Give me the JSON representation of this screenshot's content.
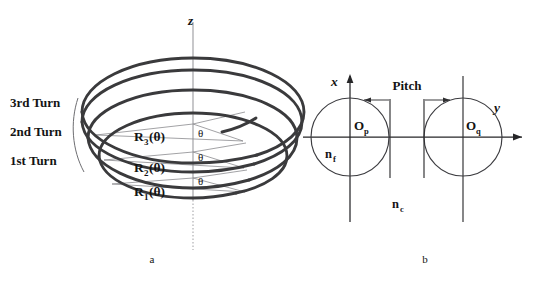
{
  "figure": {
    "background_color": "#ffffff",
    "ink_color": "#141414",
    "helix_stroke_color": "#3a3a3c",
    "thin_line_color": "#8a8a8e",
    "axis_color": "#262628"
  },
  "panel_a": {
    "caption": "a",
    "axis_label_z": "z",
    "turn_labels": [
      {
        "id": "turn-3",
        "text": "3rd Turn"
      },
      {
        "id": "turn-2",
        "text": "2nd Turn"
      },
      {
        "id": "turn-1",
        "text": "1st Turn"
      }
    ],
    "radius_labels": [
      {
        "id": "radius-3",
        "base": "R",
        "sub": "3",
        "arg": "(θ)",
        "full": "R3(θ)"
      },
      {
        "id": "radius-2",
        "base": "R",
        "sub": "2",
        "arg": "(θ)",
        "full": "R2(θ)"
      },
      {
        "id": "radius-1",
        "base": "R",
        "sub": "1",
        "arg": "(θ)",
        "full": "R1(θ)"
      }
    ],
    "angle_labels": [
      {
        "id": "theta-top",
        "text": "θ"
      },
      {
        "id": "theta-mid",
        "text": "θ"
      },
      {
        "id": "theta-bottom",
        "text": "θ"
      }
    ]
  },
  "panel_b": {
    "caption": "b",
    "axis_label_x": "x",
    "axis_label_y": "y",
    "dimension_label": "Pitch",
    "centers": [
      {
        "id": "center-p",
        "base": "O",
        "sub": "p",
        "full": "Op"
      },
      {
        "id": "center-q",
        "base": "O",
        "sub": "q",
        "full": "Oq"
      }
    ],
    "index_labels": [
      {
        "id": "index-film",
        "base": "n",
        "sub": "f",
        "full": "nf"
      },
      {
        "id": "index-clad",
        "base": "n",
        "sub": "c",
        "full": "nc"
      }
    ]
  }
}
